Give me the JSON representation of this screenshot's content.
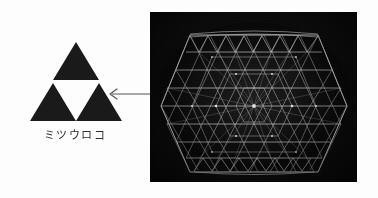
{
  "figure": {
    "background_color": "#fdfdfd",
    "width": 378,
    "height": 198
  },
  "emblem": {
    "name": "mitsu-uroko-crest",
    "caption": "ミツウロコ",
    "fill_color": "#1a1a1a",
    "triangle_count": 3,
    "description_glyph": "three stacked solid triangles forming a larger triangle with a hollow inverted centre"
  },
  "arrow": {
    "name": "comparison-arrow",
    "direction": "left",
    "color": "#555555",
    "label": ""
  },
  "photo": {
    "name": "lattice-photograph",
    "caption": "",
    "background_color": "#0a0a0a",
    "line_color": "#d8d8d8",
    "subject": "hexagonal triangulated wireframe lattice structure"
  }
}
